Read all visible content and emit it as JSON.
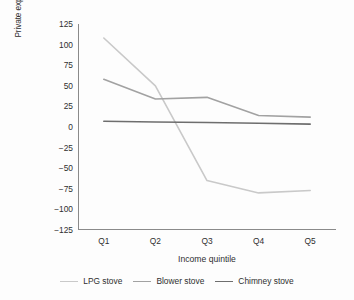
{
  "chart_data": {
    "type": "line",
    "title": "",
    "xlabel": "Income quintile",
    "ylabel": "Private expenditures averted in U.S. dollars (millions)",
    "categories": [
      "Q1",
      "Q2",
      "Q3",
      "Q4",
      "Q5"
    ],
    "ylim": [
      -125,
      125
    ],
    "yticks": [
      125,
      100,
      75,
      50,
      25,
      0,
      -25,
      -50,
      -75,
      -100,
      -125
    ],
    "ytick_labels": [
      "125",
      "100",
      "75",
      "50",
      "25",
      "0",
      "−25",
      "−50",
      "−75",
      "−100",
      "−125"
    ],
    "grid": false,
    "legend_position": "bottom",
    "series": [
      {
        "name": "LPG stove",
        "color": "#c9c9c9",
        "values": [
          108,
          50,
          -65,
          -80,
          -77
        ]
      },
      {
        "name": "Blower stove",
        "color": "#a2a2a2",
        "values": [
          58,
          34,
          36,
          14,
          12
        ]
      },
      {
        "name": "Chimney stove",
        "color": "#6e6e6e",
        "values": [
          7,
          6,
          5.5,
          4.5,
          3.5
        ]
      }
    ]
  },
  "axes": {
    "axis_color": "#8a8a8a",
    "text_color": "#2f2f2f"
  },
  "legend": {
    "items": [
      {
        "label": "LPG stove"
      },
      {
        "label": "Blower stove"
      },
      {
        "label": "Chimney stove"
      }
    ]
  }
}
